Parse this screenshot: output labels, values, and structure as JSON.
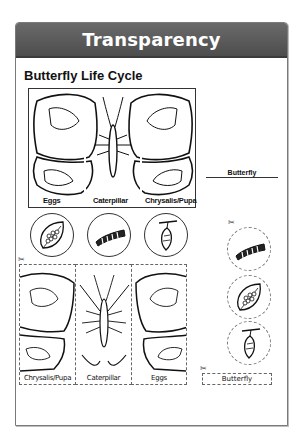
{
  "header": {
    "title": "Transparency"
  },
  "worksheet": {
    "title": "Butterfly Life Cycle",
    "top_panel": {
      "labels": [
        "Eggs",
        "Caterpillar",
        "Chrysalis/Pupa"
      ]
    },
    "answer_line": {
      "label": "Butterfly"
    },
    "stage_circles": [
      {
        "icon": "eggs-on-leaf-icon"
      },
      {
        "icon": "caterpillar-icon"
      },
      {
        "icon": "chrysalis-icon"
      }
    ],
    "cutouts": {
      "panels": [
        {
          "label": "Chrysalis/Pupa"
        },
        {
          "label": "Caterpillar"
        },
        {
          "label": "Eggs"
        }
      ],
      "circles": [
        {
          "icon": "caterpillar-icon"
        },
        {
          "icon": "eggs-on-leaf-icon"
        },
        {
          "icon": "chrysalis-icon"
        }
      ],
      "butterfly_tag": "Butterfly"
    },
    "colors": {
      "header_bg": "#5a5a5a",
      "header_text": "#ffffff",
      "frame_border": "#7a7a7a"
    }
  }
}
